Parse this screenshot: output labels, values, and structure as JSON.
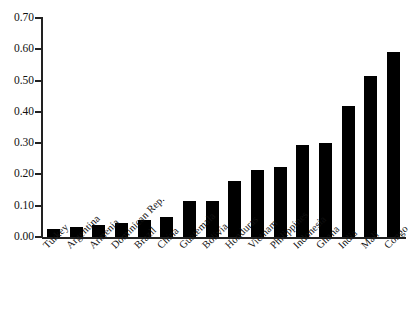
{
  "chart_data": {
    "type": "bar",
    "title": "",
    "subtitle": "",
    "xlabel": "",
    "ylabel": "",
    "ylim": [
      0.0,
      0.7
    ],
    "ytick_labels": [
      "0.00",
      "0.10",
      "0.20",
      "0.30",
      "0.40",
      "0.50",
      "0.60",
      "0.70"
    ],
    "ytick_values": [
      0.0,
      0.1,
      0.2,
      0.3,
      0.4,
      0.5,
      0.6,
      0.7
    ],
    "grid": false,
    "legend": null,
    "bar_color": "#000000",
    "axis_color": "#222222",
    "categories": [
      "Turkey",
      "Argentina",
      "Armenia",
      "Dominican Rep.",
      "Brazil",
      "China",
      "Guatemala",
      "Bolivia",
      "Honduras",
      "Vietnam",
      "Philippines",
      "Indonesia",
      "Ghana",
      "India",
      "Mali",
      "Congo"
    ],
    "values": [
      0.025,
      0.032,
      0.037,
      0.045,
      0.053,
      0.065,
      0.115,
      0.115,
      0.18,
      0.215,
      0.225,
      0.295,
      0.3,
      0.42,
      0.515,
      0.59
    ]
  }
}
